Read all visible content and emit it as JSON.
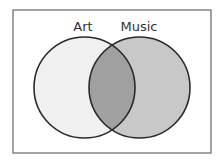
{
  "diagram": {
    "type": "venn",
    "sets": [
      {
        "id": "art",
        "label": "Art",
        "fill": "#f0f0f0",
        "stroke": "#2a2a2a",
        "cx": 84.5,
        "cy": 87.5,
        "r": 50.5,
        "label_x": 83,
        "label_y": 31
      },
      {
        "id": "music",
        "label": "Music",
        "fill": "#c8c8c8",
        "stroke": "#2a2a2a",
        "cx": 139.5,
        "cy": 87.5,
        "r": 50.5,
        "label_x": 139,
        "label_y": 31
      }
    ],
    "intersection": {
      "sets": [
        "Art",
        "Music"
      ],
      "fill": "#a0a0a0"
    },
    "frame": {
      "x": 13,
      "y": 10,
      "width": 198,
      "height": 143,
      "stroke": "#666666"
    }
  }
}
